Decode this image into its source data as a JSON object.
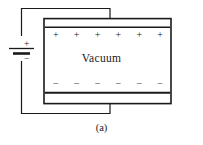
{
  "figure": {
    "caption": "(a)",
    "background_color": "#ffffff",
    "line_color": "#1a1a1a",
    "plate_fill": "#ffffff"
  },
  "capacitor": {
    "dielectric_label": "Vacuum",
    "top_plate": {
      "name": "top-plate",
      "polarity": "positive",
      "charge_symbol": "+",
      "charge_count": 6,
      "charges": [
        "+",
        "+",
        "+",
        "+",
        "+",
        "+"
      ]
    },
    "bottom_plate": {
      "name": "bottom-plate",
      "polarity": "negative",
      "charge_symbol": "−",
      "charge_count": 6,
      "charges": [
        "−",
        "−",
        "−",
        "−",
        "−",
        "−"
      ]
    }
  },
  "battery": {
    "positive_terminal_label": "+",
    "negative_terminal_label": "−"
  },
  "circuit": {
    "top_wire_name": "top-wire",
    "bottom_wire_name": "bottom-wire"
  }
}
